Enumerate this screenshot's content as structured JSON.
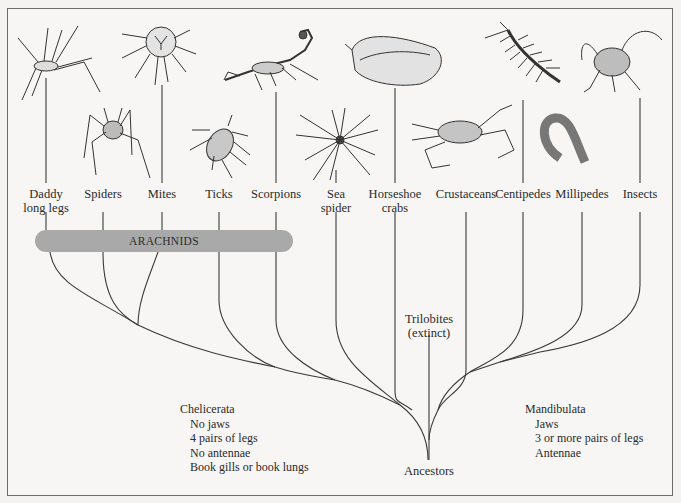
{
  "diagram": {
    "taxa": [
      {
        "id": "daddy-long-legs",
        "label_lines": [
          "Daddy",
          "long legs"
        ],
        "x": 46
      },
      {
        "id": "spiders",
        "label_lines": [
          "Spiders"
        ],
        "x": 103
      },
      {
        "id": "mites",
        "label_lines": [
          "Mites"
        ],
        "x": 162
      },
      {
        "id": "ticks",
        "label_lines": [
          "Ticks"
        ],
        "x": 219
      },
      {
        "id": "scorpions",
        "label_lines": [
          "Scorpions"
        ],
        "x": 276
      },
      {
        "id": "sea-spider",
        "label_lines": [
          "Sea",
          "spider"
        ],
        "x": 336
      },
      {
        "id": "horseshoe-crabs",
        "label_lines": [
          "Horseshoe",
          "crabs"
        ],
        "x": 395
      },
      {
        "id": "crustaceans",
        "label_lines": [
          "Crustaceans"
        ],
        "x": 466
      },
      {
        "id": "centipedes",
        "label_lines": [
          "Centipedes"
        ],
        "x": 523
      },
      {
        "id": "millipedes",
        "label_lines": [
          "Millipedes"
        ],
        "x": 582
      },
      {
        "id": "insects",
        "label_lines": [
          "Insects"
        ],
        "x": 640
      }
    ],
    "group_bar": {
      "label": "ARACHNIDS"
    },
    "extinct": {
      "label_lines": [
        "Trilobites",
        "(extinct)"
      ]
    },
    "root": {
      "label": "Ancestors"
    },
    "chelicerata": {
      "title": "Chelicerata",
      "traits": [
        "No jaws",
        "4 pairs of legs",
        "No antennae",
        "Book gills or book lungs"
      ]
    },
    "mandibulata": {
      "title": "Mandibulata",
      "traits": [
        "Jaws",
        "3 or more pairs of legs",
        "Antennae"
      ]
    },
    "colors": {
      "line": "#3a3a3a",
      "arachnid_bar": "#a9a9a9",
      "border": "#6c6c6c",
      "background": "#f7f6f4"
    }
  }
}
